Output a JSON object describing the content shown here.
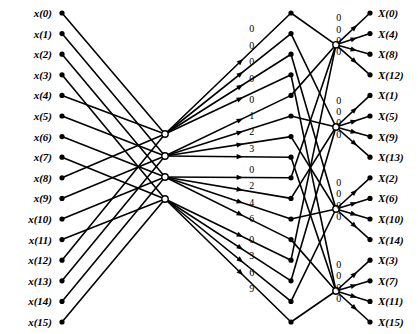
{
  "figure": {
    "type": "signal-flow-graph",
    "name": "16-point FFT butterfly flow graph",
    "width": 418,
    "height": 334,
    "background_color": "#ffffff",
    "line_color": "#000000",
    "node_color": "#000000"
  },
  "inputs": {
    "count": 16,
    "x_label": 52,
    "x_dot": 62,
    "y_start": 13,
    "y_step": 20.6,
    "labels": [
      "x(0)",
      "x(1)",
      "x(2)",
      "x(3)",
      "x(4)",
      "x(5)",
      "x(6)",
      "x(7)",
      "x(8)",
      "x(9)",
      "x(10)",
      "x(11)",
      "x(12)",
      "x(13)",
      "x(14)",
      "x(15)"
    ]
  },
  "outputs": {
    "count": 16,
    "x_label": 378,
    "x_dot": 370,
    "y_start": 13,
    "y_step": 20.6,
    "labels": [
      "X(0)",
      "X(4)",
      "X(8)",
      "X(12)",
      "X(1)",
      "X(5)",
      "X(9)",
      "X(13)",
      "X(2)",
      "X(6)",
      "X(10)",
      "X(14)",
      "X(3)",
      "X(7)",
      "X(11)",
      "X(15)"
    ]
  },
  "stage1_hubs": {
    "count": 4,
    "x": 165,
    "y": [
      134,
      156,
      177,
      199
    ],
    "radius": 3.2
  },
  "stage2_hubs": {
    "count": 4,
    "x": 336,
    "y": [
      44.8,
      127,
      209,
      291
    ],
    "radius": 3.2
  },
  "twiddle_nodes": {
    "x": 291,
    "radius": 2.6,
    "label_offset_x": -14,
    "label_offset_y": -8,
    "exponents": [
      "0",
      "0",
      "0",
      "0",
      "0",
      "1",
      "2",
      "3",
      "0",
      "2",
      "4",
      "6",
      "0",
      "3",
      "6",
      "9"
    ],
    "y": [
      13,
      33.6,
      54.2,
      74.8,
      95.4,
      116,
      136.6,
      157.2,
      177.8,
      198.4,
      219,
      239.6,
      260.2,
      280.8,
      301.4,
      322
    ]
  },
  "output_twiddles": {
    "label_offset_x": -16,
    "label_offset_y": -9,
    "exponents": [
      "0",
      "0",
      "0",
      "0",
      "0",
      "0",
      "0",
      "0",
      "0",
      "0",
      "0",
      "0",
      "0",
      "0",
      "0",
      "0"
    ]
  },
  "connections": {
    "stage1_groups": [
      {
        "hub_index": 0,
        "inputs": [
          0,
          4,
          8,
          12
        ]
      },
      {
        "hub_index": 1,
        "inputs": [
          1,
          5,
          9,
          13
        ]
      },
      {
        "hub_index": 2,
        "inputs": [
          2,
          6,
          10,
          14
        ]
      },
      {
        "hub_index": 3,
        "inputs": [
          3,
          7,
          11,
          15
        ]
      }
    ],
    "stage1_to_twiddle": [
      {
        "hub_index": 0,
        "twiddles": [
          0,
          1,
          2,
          3
        ]
      },
      {
        "hub_index": 1,
        "twiddles": [
          4,
          5,
          6,
          7
        ]
      },
      {
        "hub_index": 2,
        "twiddles": [
          8,
          9,
          10,
          11
        ]
      },
      {
        "hub_index": 3,
        "twiddles": [
          12,
          13,
          14,
          15
        ]
      }
    ],
    "twiddle_to_stage2": [
      {
        "hub_index": 0,
        "twiddles": [
          0,
          4,
          8,
          12
        ]
      },
      {
        "hub_index": 1,
        "twiddles": [
          1,
          5,
          9,
          13
        ]
      },
      {
        "hub_index": 2,
        "twiddles": [
          2,
          6,
          10,
          14
        ]
      },
      {
        "hub_index": 3,
        "twiddles": [
          3,
          7,
          11,
          15
        ]
      }
    ],
    "stage2_to_outputs": [
      {
        "hub_index": 0,
        "outputs": [
          0,
          1,
          2,
          3
        ]
      },
      {
        "hub_index": 1,
        "outputs": [
          4,
          5,
          6,
          7
        ]
      },
      {
        "hub_index": 2,
        "outputs": [
          8,
          9,
          10,
          11
        ]
      },
      {
        "hub_index": 3,
        "outputs": [
          12,
          13,
          14,
          15
        ]
      }
    ]
  }
}
